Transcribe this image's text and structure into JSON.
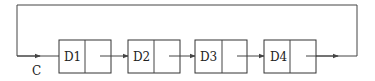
{
  "diagram": {
    "title": "",
    "colors": {
      "line": "#444444",
      "box_stroke": "#333333",
      "text": "#222222",
      "background": "#ffffff"
    },
    "input_label": "C",
    "nodes": [
      {
        "id": "D1",
        "label": "D1",
        "x": 59,
        "divider_x": 85
      },
      {
        "id": "D2",
        "label": "D2",
        "x": 128,
        "divider_x": 154
      },
      {
        "id": "D3",
        "label": "D3",
        "x": 195,
        "divider_x": 222
      },
      {
        "id": "D4",
        "label": "D4",
        "x": 264,
        "divider_x": 290
      }
    ],
    "node_box": {
      "width": 52,
      "top": 40,
      "height": 33
    },
    "edges": [
      {
        "from": "C",
        "to": "D1"
      },
      {
        "from": "D1",
        "to": "D2"
      },
      {
        "from": "D2",
        "to": "D3"
      },
      {
        "from": "D3",
        "to": "D4"
      },
      {
        "from": "D4",
        "to": "C",
        "type": "feedback-loop"
      }
    ],
    "loop": {
      "left_x": 17,
      "right_x": 357,
      "top_y": 5,
      "mid_y": 56
    }
  }
}
